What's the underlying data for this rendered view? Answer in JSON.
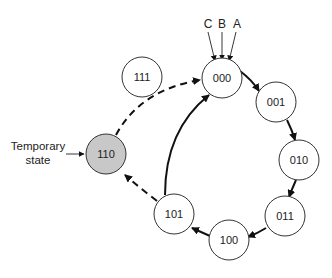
{
  "diagram": {
    "type": "state-transition",
    "inputs": [
      {
        "label": "C"
      },
      {
        "label": "B"
      },
      {
        "label": "A"
      }
    ],
    "states": [
      {
        "id": "000",
        "label": "000",
        "fill": "#ffffff"
      },
      {
        "id": "001",
        "label": "001",
        "fill": "#ffffff"
      },
      {
        "id": "010",
        "label": "010",
        "fill": "#ffffff"
      },
      {
        "id": "011",
        "label": "011",
        "fill": "#ffffff"
      },
      {
        "id": "100",
        "label": "100",
        "fill": "#ffffff"
      },
      {
        "id": "101",
        "label": "101",
        "fill": "#ffffff"
      },
      {
        "id": "110",
        "label": "110",
        "fill": "#c8c8c8"
      },
      {
        "id": "111",
        "label": "111",
        "fill": "#ffffff"
      }
    ],
    "transitions": [
      {
        "from": "000",
        "to": "001",
        "style": "solid"
      },
      {
        "from": "001",
        "to": "010",
        "style": "solid"
      },
      {
        "from": "010",
        "to": "011",
        "style": "solid"
      },
      {
        "from": "011",
        "to": "100",
        "style": "solid"
      },
      {
        "from": "100",
        "to": "101",
        "style": "solid"
      },
      {
        "from": "101",
        "to": "000",
        "style": "solid"
      },
      {
        "from": "101",
        "to": "110",
        "style": "dashed"
      },
      {
        "from": "110",
        "to": "000",
        "style": "dashed"
      }
    ],
    "annotation": {
      "line1": "Temporary",
      "line2": "state",
      "points_to": "110"
    }
  }
}
